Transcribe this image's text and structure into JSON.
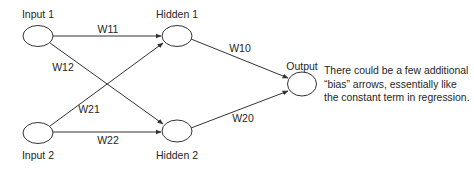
{
  "diagram": {
    "type": "neural-network",
    "colors": {
      "stroke": "#333333",
      "text": "#262626",
      "background": "#ffffff"
    },
    "nodes": [
      {
        "id": "input1",
        "label": "Input 1",
        "cx": 38,
        "cy": 36,
        "rx": 15,
        "ry": 10.5,
        "label_x": 38,
        "label_y": 18
      },
      {
        "id": "input2",
        "label": "Input 2",
        "cx": 38,
        "cy": 133,
        "rx": 15,
        "ry": 10.5,
        "label_x": 38,
        "label_y": 159
      },
      {
        "id": "hidden1",
        "label": "Hidden 1",
        "cx": 177,
        "cy": 36,
        "rx": 15,
        "ry": 10.5,
        "label_x": 177,
        "label_y": 18
      },
      {
        "id": "hidden2",
        "label": "Hidden 2",
        "cx": 177,
        "cy": 131,
        "rx": 15,
        "ry": 11,
        "label_x": 177,
        "label_y": 159
      },
      {
        "id": "output",
        "label": "Output",
        "cx": 302,
        "cy": 84,
        "rx": 14.5,
        "ry": 12,
        "label_x": 302,
        "label_y": 70
      }
    ],
    "edges": [
      {
        "from": "input1",
        "to": "hidden1",
        "label": "W11",
        "x1": 53,
        "y1": 36,
        "x2": 161,
        "y2": 36,
        "label_x": 108,
        "label_y": 33
      },
      {
        "from": "input1",
        "to": "hidden2",
        "label": "W12",
        "x1": 50,
        "y1": 43,
        "x2": 163,
        "y2": 124,
        "label_x": 63,
        "label_y": 71
      },
      {
        "from": "input2",
        "to": "hidden1",
        "label": "W21",
        "x1": 50,
        "y1": 126,
        "x2": 163,
        "y2": 43,
        "label_x": 89,
        "label_y": 113
      },
      {
        "from": "input2",
        "to": "hidden2",
        "label": "W22",
        "x1": 53,
        "y1": 132,
        "x2": 161,
        "y2": 132,
        "label_x": 108,
        "label_y": 144
      },
      {
        "from": "hidden1",
        "to": "output",
        "label": "W10",
        "x1": 191,
        "y1": 39,
        "x2": 288,
        "y2": 78,
        "label_x": 240,
        "label_y": 52
      },
      {
        "from": "hidden2",
        "to": "output",
        "label": "W20",
        "x1": 191,
        "y1": 128,
        "x2": 288,
        "y2": 91,
        "label_x": 243,
        "label_y": 122
      }
    ],
    "note": {
      "lines": [
        "There could be a few additional",
        "“bias” arrows, essentially like",
        "the constant term in regression."
      ]
    }
  }
}
